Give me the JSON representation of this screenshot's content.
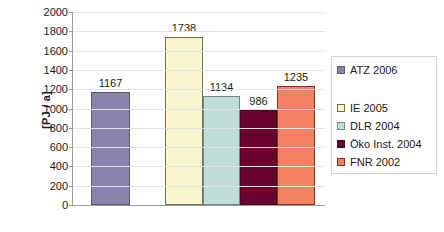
{
  "chart_data": {
    "type": "bar",
    "title": "",
    "subtitle": "",
    "xlabel": "",
    "ylabel": "[PJ / a]",
    "ylim": [
      0,
      2000
    ],
    "ytick_step": 200,
    "yticks": [
      "2000",
      "1800",
      "1600",
      "1400",
      "1200",
      "1000",
      "800",
      "600",
      "400",
      "200",
      "0"
    ],
    "grid": true,
    "xtick_labels": [],
    "legend_position": "right",
    "categories": [
      "ATZ 2006",
      "IE 2005",
      "DLR 2004",
      "Öko Inst. 2004",
      "FNR 2002"
    ],
    "values": [
      1167,
      1738,
      1134,
      986,
      1235
    ],
    "data_labels": [
      "1167",
      "1738",
      "1134",
      "986",
      "1235"
    ],
    "bars": [
      {
        "name": "ATZ 2006",
        "value": 1167,
        "label": "1167",
        "color": "#8884ad",
        "border": "#5d5d5d",
        "hatched": false,
        "x": 19,
        "width": 39
      },
      {
        "name": "IE 2005",
        "value": 1738,
        "label": "1738",
        "color": "#f7f6cd",
        "border": "#6f6f58",
        "hatched": false,
        "x": 93,
        "width": 38
      },
      {
        "name": "DLR 2004",
        "value": 1134,
        "label": "1134",
        "color": "#bfdeda",
        "border": "#6f8b88",
        "hatched": false,
        "x": 131,
        "width": 37
      },
      {
        "name": "Öko Inst. 2004",
        "value": 986,
        "label": "986",
        "color": "#69042f",
        "border": "#4a0220",
        "hatched": false,
        "x": 168,
        "width": 37
      },
      {
        "name": "FNR 2002",
        "value": 1235,
        "label": "1235",
        "color": "#f38262",
        "border": "#7a3420",
        "hatched": true,
        "x": 205,
        "width": 38
      }
    ]
  },
  "legend": {
    "items": [
      {
        "label": "ATZ 2006",
        "color": "#8884ad",
        "border": "#5d5d5d",
        "hatched": false,
        "top": 6
      },
      {
        "label": "IE 2005",
        "color": "#f7f6cd",
        "border": "#6f6f58",
        "hatched": false,
        "top": 44
      },
      {
        "label": "DLR 2004",
        "color": "#bfdeda",
        "border": "#6f8b88",
        "hatched": false,
        "top": 62
      },
      {
        "label": "Öko Inst. 2004",
        "color": "#69042f",
        "border": "#4a0220",
        "hatched": false,
        "top": 80
      },
      {
        "label": "FNR 2002",
        "color": "#f38262",
        "border": "#7a3420",
        "hatched": true,
        "top": 98
      }
    ]
  },
  "colors": {
    "grid": "#e2e2e2",
    "axis": "#9a9a9a",
    "text": "#1a1a1a",
    "background": "#ffffff",
    "legend_border": "#d2d2d2"
  }
}
